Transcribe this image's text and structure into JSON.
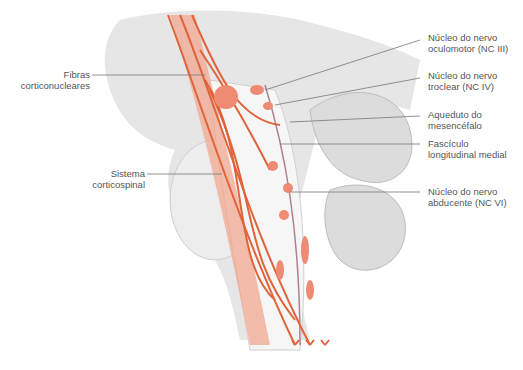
{
  "figure": {
    "type": "anatomical-illustration",
    "colors": {
      "pathway": "#e0633a",
      "pathway_light": "#f2a38a",
      "tissue": "#e4e4e4",
      "tissue_dark": "#c8c8c8",
      "label_text": "#555555",
      "leader_line": "#777777"
    }
  },
  "labels_left": [
    {
      "id": "fibras",
      "line1": "Fibras",
      "line2": "corticonucleares"
    },
    {
      "id": "sistema",
      "line1": "Sistema",
      "line2": "corticospinal"
    }
  ],
  "labels_right": [
    {
      "id": "oculomotor",
      "line1": "Núcleo do nervo",
      "line2": "oculomotor (NC III)"
    },
    {
      "id": "troclear",
      "line1": "Núcleo do nervo",
      "line2": "troclear (NC IV)"
    },
    {
      "id": "aqueduto",
      "line1": "Aqueduto do",
      "line2": "mesencéfalo"
    },
    {
      "id": "fasciculo",
      "line1": "Fascículo",
      "line2": "longitudinal medial"
    },
    {
      "id": "abducente",
      "line1": "Núcleo do nervo",
      "line2": "abducente (NC VI)"
    }
  ]
}
